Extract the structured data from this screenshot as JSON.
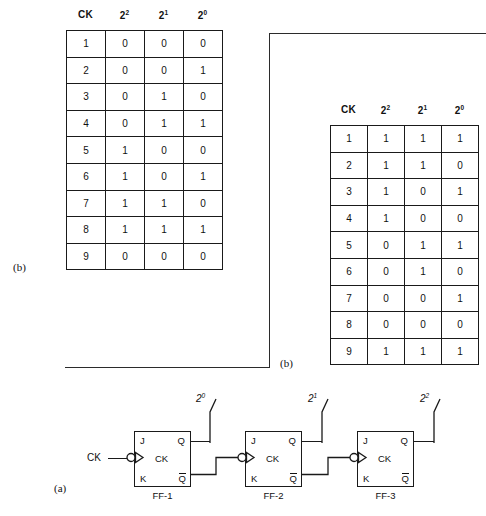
{
  "figure": {
    "label_a": "(a)",
    "label_b_left": "(b)",
    "label_b_right": "(b)"
  },
  "table_b_left": {
    "headers": [
      "CK",
      "2",
      "2",
      "2"
    ],
    "header_exponents": [
      "",
      "2",
      "1",
      "0"
    ],
    "rows": [
      [
        "1",
        "0",
        "0",
        "0"
      ],
      [
        "2",
        "0",
        "0",
        "1"
      ],
      [
        "3",
        "0",
        "1",
        "0"
      ],
      [
        "4",
        "0",
        "1",
        "1"
      ],
      [
        "5",
        "1",
        "0",
        "0"
      ],
      [
        "6",
        "1",
        "0",
        "1"
      ],
      [
        "7",
        "1",
        "1",
        "0"
      ],
      [
        "8",
        "1",
        "1",
        "1"
      ],
      [
        "9",
        "0",
        "0",
        "0"
      ]
    ]
  },
  "table_b_right": {
    "headers": [
      "CK",
      "2",
      "2",
      "2"
    ],
    "header_exponents": [
      "",
      "2",
      "1",
      "0"
    ],
    "rows": [
      [
        "1",
        "1",
        "1",
        "1"
      ],
      [
        "2",
        "1",
        "1",
        "0"
      ],
      [
        "3",
        "1",
        "0",
        "1"
      ],
      [
        "4",
        "1",
        "0",
        "0"
      ],
      [
        "5",
        "0",
        "1",
        "1"
      ],
      [
        "6",
        "0",
        "1",
        "0"
      ],
      [
        "7",
        "0",
        "0",
        "1"
      ],
      [
        "8",
        "0",
        "0",
        "0"
      ],
      [
        "9",
        "1",
        "1",
        "1"
      ]
    ]
  },
  "circuit": {
    "clock_input_label": "CK",
    "flipflops": [
      {
        "name": "FF-1",
        "pin_j": "J",
        "pin_k": "K",
        "pin_q": "Q",
        "pin_qbar": "Q",
        "pin_ck": "CK",
        "output_label": "2",
        "output_exponent": "0"
      },
      {
        "name": "FF-2",
        "pin_j": "J",
        "pin_k": "K",
        "pin_q": "Q",
        "pin_qbar": "Q",
        "pin_ck": "CK",
        "output_label": "2",
        "output_exponent": "1"
      },
      {
        "name": "FF-3",
        "pin_j": "J",
        "pin_k": "K",
        "pin_q": "Q",
        "pin_qbar": "Q",
        "pin_ck": "CK",
        "output_label": "2",
        "output_exponent": "2"
      }
    ]
  },
  "colors": {
    "ink": "#111111",
    "line": "#1a1a1a",
    "background": "#ffffff"
  }
}
